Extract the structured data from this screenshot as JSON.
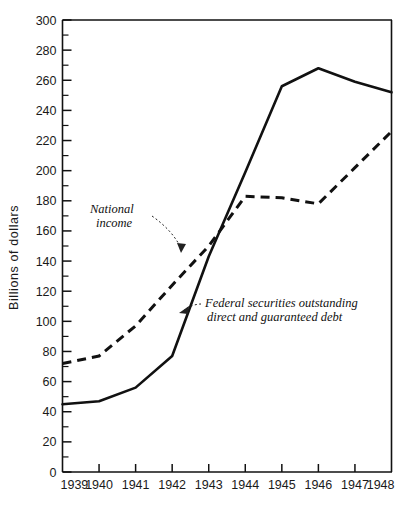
{
  "chart_data": {
    "type": "line",
    "title": "",
    "subtitle": "",
    "xlabel": "",
    "ylabel": "Billions of dollars",
    "categories": [
      "1939",
      "1940",
      "1941",
      "1942",
      "1943",
      "1944",
      "1945",
      "1946",
      "1947",
      "1948"
    ],
    "x": [
      1939,
      1940,
      1941,
      1942,
      1943,
      1944,
      1945,
      1946,
      1947,
      1948
    ],
    "xlim": [
      1939,
      1948
    ],
    "ylim": [
      0,
      300
    ],
    "y_ticks": [
      0,
      20,
      40,
      60,
      80,
      100,
      120,
      140,
      160,
      180,
      200,
      220,
      240,
      260,
      280,
      300
    ],
    "y_minor_step": 10,
    "grid": false,
    "legend_position": "inline-annotations",
    "series": [
      {
        "name": "Federal securities outstanding direct and guaranteed debt",
        "style": "solid",
        "values": [
          45,
          47,
          56,
          77,
          143,
          199,
          256,
          268,
          259,
          252
        ]
      },
      {
        "name": "National income",
        "style": "dashed",
        "values": [
          72,
          77,
          97,
          124,
          150,
          183,
          182,
          178,
          202,
          226
        ]
      }
    ],
    "annotations": [
      {
        "id": "national-income-label",
        "text_lines": [
          "National",
          "income"
        ],
        "points_to_series": "National income",
        "points_to_x": 1943
      },
      {
        "id": "federal-securities-label",
        "text_lines": [
          "Federal securities outstanding",
          "direct and guaranteed debt"
        ],
        "points_to_series": "Federal securities outstanding direct and guaranteed debt",
        "points_to_x": 1942.6
      }
    ]
  },
  "axes": {
    "y_tick_labels": [
      "0",
      "20",
      "40",
      "60",
      "80",
      "100",
      "120",
      "140",
      "160",
      "180",
      "200",
      "220",
      "240",
      "260",
      "280",
      "300"
    ],
    "x_tick_labels": [
      "1939",
      "1940",
      "1941",
      "1942",
      "1943",
      "1944",
      "1945",
      "1946",
      "1947",
      "1948"
    ],
    "y_axis_title": "Billions of dollars"
  },
  "annotations": {
    "national_income_line1": "National",
    "national_income_line2": "income",
    "federal_line1": "Federal securities outstanding",
    "federal_line2": "direct and guaranteed debt"
  },
  "colors": {
    "ink": "#111111",
    "background": "#ffffff"
  }
}
